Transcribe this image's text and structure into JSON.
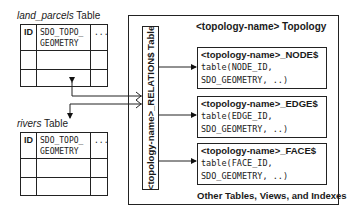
{
  "land_parcels": {
    "title_italic": "land_parcels",
    "title_suffix": " Table",
    "columns": [
      "ID",
      "SDO_TOPO_\nGEOMETRY",
      "..."
    ],
    "col1": "ID",
    "col2_line1": "SDO_TOPO_",
    "col2_line2": "GEOMETRY",
    "col3": "..."
  },
  "rivers": {
    "title_italic": "rivers",
    "title_suffix": " Table",
    "col1": "ID",
    "col2_line1": "SDO_TOPO_",
    "col2_line2": "GEOMETRY",
    "col3": "..."
  },
  "topology": {
    "title": "<topology-name> Topology",
    "relation_table": "<topology-name>_RELATION$ Table",
    "tables": [
      {
        "name": "<topology-name>_NODE$",
        "line1": "table(NODE_ID,",
        "line2": "SDO_GEOMETRY, ..)"
      },
      {
        "name": "<topology-name>_EDGE$",
        "line1": "table(EDGE_ID,",
        "line2": "SDO_GEOMETRY, ..)"
      },
      {
        "name": "<topology-name>_FACE$",
        "line1": "table(FACE_ID,",
        "line2": "SDO_GEOMETRY, ..)"
      }
    ],
    "other": "Other Tables, Views, and Indexes"
  }
}
